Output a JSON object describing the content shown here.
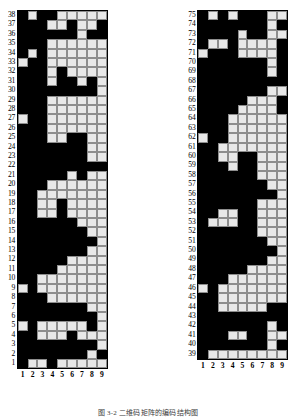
{
  "figure": {
    "caption": "图 3-2  二维码矩阵的编码结构图",
    "type": "binary-matrix-pair"
  },
  "chart_data": {
    "type": "heatmap",
    "title": "图 3-2  二维码矩阵的编码结构图",
    "xlabel": "",
    "ylabel": "",
    "grid": true,
    "legend": "none",
    "colors": {
      "on": "#000000",
      "off": "#e8e8e8",
      "gridline": "#8d8d8d",
      "border": "#000000"
    },
    "value_meaning": {
      "1": "black module",
      "0": "white module"
    },
    "columns": [
      "1",
      "2",
      "3",
      "4",
      "5",
      "6",
      "7",
      "8",
      "9"
    ],
    "panels": [
      {
        "name": "left-panel",
        "row_range": [
          1,
          38
        ],
        "row_labels": [
          "38",
          "37",
          "36",
          "35",
          "34",
          "33",
          "32",
          "31",
          "30",
          "29",
          "28",
          "27",
          "26",
          "25",
          "24",
          "23",
          "22",
          "21",
          "20",
          "19",
          "18",
          "17",
          "16",
          "15",
          "14",
          "13",
          "12",
          "11",
          "10",
          "9",
          "8",
          "7",
          "6",
          "5",
          "4",
          "3",
          "2",
          "1"
        ],
        "rows_top_to_bottom": [
          [
            1,
            0,
            1,
            1,
            0,
            0,
            0,
            0,
            0
          ],
          [
            1,
            1,
            1,
            0,
            0,
            1,
            0,
            0,
            1
          ],
          [
            1,
            1,
            1,
            1,
            1,
            1,
            0,
            1,
            1
          ],
          [
            1,
            1,
            1,
            0,
            0,
            0,
            0,
            0,
            0
          ],
          [
            1,
            0,
            1,
            0,
            0,
            0,
            0,
            0,
            0
          ],
          [
            0,
            1,
            1,
            0,
            0,
            0,
            0,
            0,
            0
          ],
          [
            1,
            1,
            1,
            0,
            1,
            0,
            0,
            0,
            0
          ],
          [
            1,
            1,
            1,
            0,
            1,
            1,
            0,
            1,
            0
          ],
          [
            1,
            1,
            1,
            1,
            1,
            1,
            1,
            1,
            0
          ],
          [
            1,
            1,
            1,
            0,
            0,
            0,
            0,
            0,
            0
          ],
          [
            1,
            1,
            1,
            0,
            0,
            0,
            0,
            0,
            0
          ],
          [
            0,
            1,
            1,
            0,
            0,
            0,
            0,
            0,
            0
          ],
          [
            1,
            1,
            1,
            0,
            0,
            0,
            0,
            0,
            0
          ],
          [
            1,
            1,
            1,
            0,
            0,
            1,
            1,
            0,
            0
          ],
          [
            1,
            1,
            1,
            1,
            1,
            1,
            1,
            0,
            0
          ],
          [
            1,
            1,
            1,
            1,
            1,
            1,
            1,
            0,
            0
          ],
          [
            1,
            1,
            1,
            1,
            1,
            1,
            1,
            1,
            1
          ],
          [
            1,
            1,
            1,
            1,
            1,
            0,
            1,
            0,
            0
          ],
          [
            1,
            1,
            1,
            0,
            0,
            0,
            0,
            0,
            0
          ],
          [
            1,
            1,
            0,
            0,
            0,
            0,
            0,
            0,
            0
          ],
          [
            1,
            1,
            0,
            0,
            1,
            0,
            0,
            0,
            0
          ],
          [
            1,
            1,
            0,
            0,
            1,
            0,
            0,
            0,
            0
          ],
          [
            1,
            1,
            1,
            1,
            1,
            1,
            0,
            0,
            0
          ],
          [
            1,
            1,
            1,
            1,
            1,
            1,
            1,
            0,
            0
          ],
          [
            1,
            1,
            1,
            1,
            1,
            1,
            1,
            1,
            0
          ],
          [
            1,
            1,
            1,
            1,
            1,
            1,
            1,
            0,
            0
          ],
          [
            1,
            1,
            1,
            1,
            1,
            0,
            0,
            0,
            0
          ],
          [
            1,
            1,
            1,
            1,
            0,
            0,
            0,
            0,
            0
          ],
          [
            1,
            1,
            0,
            0,
            0,
            0,
            0,
            0,
            0
          ],
          [
            0,
            1,
            0,
            0,
            0,
            0,
            0,
            0,
            0
          ],
          [
            1,
            1,
            1,
            0,
            0,
            0,
            0,
            0,
            0
          ],
          [
            1,
            1,
            1,
            1,
            1,
            1,
            1,
            0,
            0
          ],
          [
            1,
            1,
            1,
            1,
            1,
            1,
            1,
            1,
            0
          ],
          [
            0,
            1,
            0,
            0,
            0,
            0,
            0,
            1,
            0
          ],
          [
            1,
            1,
            0,
            0,
            0,
            1,
            0,
            0,
            0
          ],
          [
            1,
            1,
            1,
            1,
            1,
            1,
            1,
            1,
            0
          ],
          [
            1,
            1,
            1,
            1,
            1,
            1,
            1,
            0,
            1
          ],
          [
            1,
            0,
            0,
            1,
            0,
            0,
            0,
            0,
            0
          ]
        ]
      },
      {
        "name": "right-panel",
        "row_range": [
          39,
          75
        ],
        "row_labels": [
          "75",
          "74",
          "73",
          "72",
          "71",
          "70",
          "69",
          "68",
          "67",
          "66",
          "65",
          "64",
          "63",
          "62",
          "61",
          "60",
          "59",
          "58",
          "57",
          "56",
          "55",
          "54",
          "53",
          "52",
          "51",
          "50",
          "49",
          "48",
          "47",
          "46",
          "45",
          "44",
          "43",
          "42",
          "41",
          "40",
          "39"
        ],
        "rows_top_to_bottom": [
          [
            1,
            0,
            1,
            0,
            1,
            1,
            1,
            0,
            0
          ],
          [
            1,
            1,
            1,
            1,
            1,
            1,
            1,
            0,
            1
          ],
          [
            1,
            1,
            1,
            1,
            0,
            1,
            1,
            0,
            0
          ],
          [
            1,
            0,
            0,
            1,
            0,
            0,
            0,
            0,
            1
          ],
          [
            0,
            1,
            1,
            1,
            0,
            0,
            0,
            0,
            1
          ],
          [
            1,
            1,
            1,
            1,
            1,
            1,
            1,
            0,
            1
          ],
          [
            1,
            1,
            1,
            1,
            1,
            1,
            1,
            0,
            1
          ],
          [
            1,
            1,
            1,
            1,
            1,
            1,
            1,
            1,
            1
          ],
          [
            1,
            1,
            1,
            1,
            1,
            1,
            1,
            0,
            0
          ],
          [
            1,
            1,
            1,
            1,
            1,
            0,
            0,
            0,
            1
          ],
          [
            1,
            1,
            1,
            1,
            0,
            0,
            0,
            0,
            1
          ],
          [
            1,
            1,
            1,
            0,
            0,
            0,
            0,
            0,
            0
          ],
          [
            1,
            1,
            1,
            0,
            0,
            0,
            0,
            0,
            0
          ],
          [
            0,
            1,
            1,
            0,
            0,
            0,
            0,
            0,
            0
          ],
          [
            1,
            1,
            0,
            0,
            0,
            0,
            0,
            0,
            0
          ],
          [
            1,
            1,
            0,
            0,
            1,
            1,
            0,
            0,
            0
          ],
          [
            1,
            1,
            1,
            0,
            1,
            1,
            0,
            0,
            0
          ],
          [
            1,
            1,
            1,
            1,
            1,
            1,
            0,
            0,
            0
          ],
          [
            1,
            1,
            1,
            1,
            1,
            1,
            1,
            0,
            0
          ],
          [
            1,
            1,
            1,
            1,
            1,
            1,
            1,
            1,
            0
          ],
          [
            1,
            1,
            1,
            1,
            1,
            1,
            0,
            0,
            0
          ],
          [
            1,
            1,
            0,
            0,
            1,
            1,
            0,
            0,
            0
          ],
          [
            1,
            0,
            0,
            0,
            1,
            1,
            0,
            0,
            0
          ],
          [
            1,
            1,
            1,
            1,
            1,
            1,
            0,
            0,
            0
          ],
          [
            1,
            1,
            1,
            1,
            1,
            1,
            1,
            0,
            0
          ],
          [
            1,
            1,
            1,
            1,
            1,
            1,
            1,
            1,
            0
          ],
          [
            1,
            1,
            1,
            1,
            1,
            1,
            1,
            0,
            0
          ],
          [
            1,
            1,
            1,
            1,
            1,
            0,
            0,
            0,
            0
          ],
          [
            1,
            1,
            1,
            0,
            0,
            0,
            0,
            0,
            0
          ],
          [
            0,
            1,
            0,
            0,
            0,
            0,
            0,
            0,
            0
          ],
          [
            1,
            1,
            0,
            0,
            0,
            0,
            0,
            0,
            0
          ],
          [
            1,
            1,
            0,
            0,
            0,
            0,
            0,
            1,
            1
          ],
          [
            1,
            1,
            1,
            1,
            1,
            1,
            1,
            1,
            1
          ],
          [
            1,
            1,
            1,
            1,
            1,
            1,
            1,
            0,
            1
          ],
          [
            1,
            1,
            1,
            0,
            0,
            1,
            1,
            0,
            0
          ],
          [
            1,
            1,
            1,
            1,
            1,
            1,
            1,
            0,
            1
          ],
          [
            1,
            0,
            0,
            0,
            0,
            0,
            0,
            0,
            0
          ]
        ]
      }
    ]
  }
}
